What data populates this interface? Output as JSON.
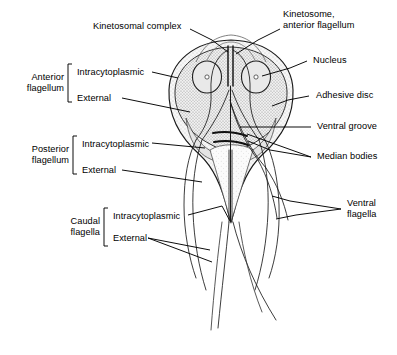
{
  "figure": {
    "background_color": "#ffffff",
    "ink_color": "#000000",
    "cytoplasm_fill": "#f2f2f2",
    "stipple_color": "#8a8a8a",
    "width": 397,
    "height": 355
  },
  "labels": {
    "kinetosomal_complex": "Kinetosomal complex",
    "kinetosome_anterior_flagellum_line1": "Kinetosome,",
    "kinetosome_anterior_flagellum_line2": "anterior flagellum",
    "nucleus": "Nucleus",
    "adhesive_disc": "Adhesive disc",
    "ventral_groove": "Ventral groove",
    "median_bodies": "Median bodies",
    "ventral_flagella_line1": "Ventral",
    "ventral_flagella_line2": "flagella"
  },
  "groups": [
    {
      "id": "anterior-flagellum",
      "name_line1": "Anterior",
      "name_line2": "flagellum",
      "items": [
        "Intracytoplasmic",
        "External"
      ]
    },
    {
      "id": "posterior-flagellum",
      "name_line1": "Posterior",
      "name_line2": "flagellum",
      "items": [
        "Intracytoplasmic",
        "External"
      ]
    },
    {
      "id": "caudal-flagella",
      "name_line1": "Caudal",
      "name_line2": "flagella",
      "items": [
        "Intracytoplasmic",
        "External"
      ]
    }
  ]
}
